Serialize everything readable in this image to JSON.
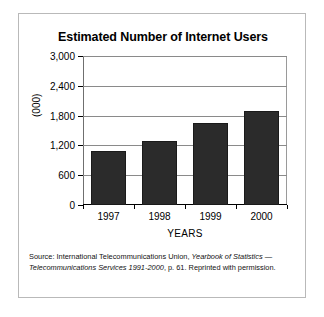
{
  "chart_data": {
    "type": "bar",
    "title": "Estimated Number of Internet Users",
    "xlabel": "YEARS",
    "ylabel": "(000)",
    "categories": [
      "1997",
      "1998",
      "1999",
      "2000"
    ],
    "values": [
      1080,
      1280,
      1660,
      1900
    ],
    "ylim": [
      0,
      3000
    ],
    "yticks": [
      0,
      600,
      1200,
      1800,
      2400,
      3000
    ],
    "ytick_labels": [
      "0",
      "600",
      "1,200",
      "1,800",
      "2,400",
      "3,000"
    ],
    "grid": true,
    "legend": "none",
    "bar_color": "#2b2b2b"
  },
  "source": {
    "prefix": "Source: International Telecommunications Union, ",
    "italic_title": "Yearbook of Statistics — Telecommunications Services 1991-2000",
    "suffix": ", p. 61. Reprinted with permission."
  }
}
